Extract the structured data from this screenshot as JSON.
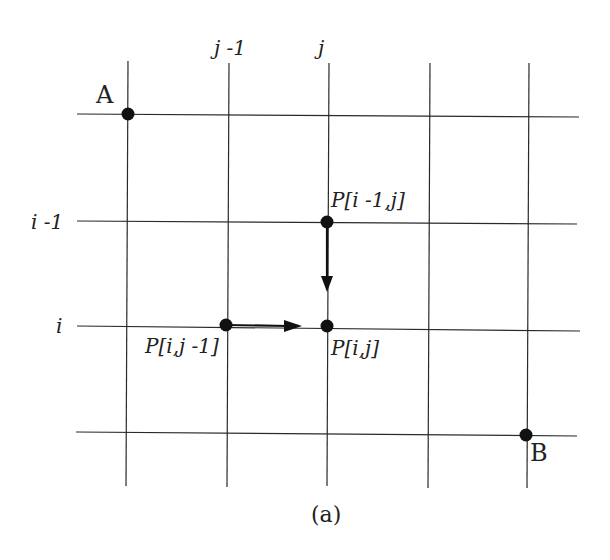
{
  "figure": {
    "caption": "(a)",
    "colors": {
      "line": "#2a2a2a",
      "point": "#111111",
      "text": "#222222",
      "background": "#ffffff"
    }
  },
  "grid": {
    "column_labels": [
      {
        "text": "j -1",
        "col": 1
      },
      {
        "text": "j",
        "col": 2
      }
    ],
    "row_labels": [
      {
        "text": "i -1",
        "row": 1
      },
      {
        "text": "i",
        "row": 2
      }
    ],
    "columns_x": [
      128,
      229,
      327,
      430,
      528
    ],
    "rows_y": [
      115,
      222,
      327,
      433
    ]
  },
  "points": {
    "A": {
      "label": "A",
      "x": 128,
      "y": 114
    },
    "B": {
      "label": "B",
      "x": 526,
      "y": 435
    },
    "p_up": {
      "label": "P[i -1,j]",
      "x": 327,
      "y": 222
    },
    "p_left": {
      "label": "P[i,j -1]",
      "x": 226,
      "y": 325
    },
    "p_center": {
      "label": "P[i,j]",
      "x": 327,
      "y": 326
    }
  },
  "arrows": [
    {
      "name": "arrow-down",
      "from": "P[i -1,j]",
      "to": "P[i,j]"
    },
    {
      "name": "arrow-right",
      "from": "P[i,j -1]",
      "to": "P[i,j]"
    }
  ]
}
